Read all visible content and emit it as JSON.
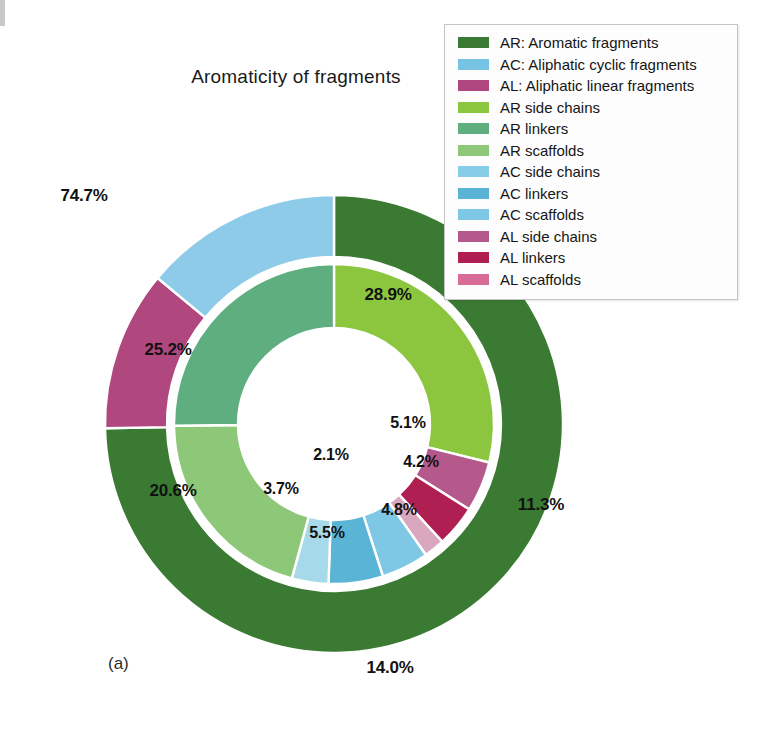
{
  "figure": {
    "panel_label": "(a)",
    "title": "Aromaticity of fragments"
  },
  "legend": {
    "items": [
      {
        "label": "AR: Aromatic fragments",
        "color": "#3b7a33"
      },
      {
        "label": "AC: Aliphatic cyclic fragments",
        "color": "#76c3e4"
      },
      {
        "label": "AL: Aliphatic linear fragments",
        "color": "#b0477e"
      },
      {
        "label": "AR side chains",
        "color": "#8cc63f"
      },
      {
        "label": "AR linkers",
        "color": "#5fae7f"
      },
      {
        "label": "AR scaffolds",
        "color": "#8dc878"
      },
      {
        "label": "AC side chains",
        "color": "#87cde8"
      },
      {
        "label": "AC linkers",
        "color": "#5ab4d6"
      },
      {
        "label": "AC scaffolds",
        "color": "#7ec8e6"
      },
      {
        "label": "AL side chains",
        "color": "#b5588c"
      },
      {
        "label": "AL linkers",
        "color": "#b01f52"
      },
      {
        "label": "AL scaffolds",
        "color": "#d96c96"
      }
    ]
  },
  "chart_data": {
    "type": "pie",
    "title": "Aromaticity of fragments",
    "subtitle": "",
    "xlabel": "",
    "ylabel": "",
    "units": "percent",
    "legend_position": "top-right",
    "rings": [
      {
        "name": "outer",
        "role": "fragment class totals",
        "slices": [
          {
            "label": "AR: Aromatic fragments",
            "short": "AR",
            "value": 74.7,
            "display": "74.7%",
            "color": "#3b7a33"
          },
          {
            "label": "AL: Aliphatic linear fragments",
            "short": "AL",
            "value": 11.3,
            "display": "11.3%",
            "color": "#b0477e"
          },
          {
            "label": "AC: Aliphatic cyclic fragments",
            "short": "AC",
            "value": 14.0,
            "display": "14.0%",
            "color": "#8ecbe8"
          }
        ]
      },
      {
        "name": "inner",
        "role": "fragment subtype breakdown",
        "slices": [
          {
            "label": "AR side chains",
            "value": 28.9,
            "display": "28.9%",
            "color": "#8cc63f"
          },
          {
            "label": "AL side chains",
            "value": 5.1,
            "display": "5.1%",
            "color": "#b5588c"
          },
          {
            "label": "AL linkers",
            "value": 4.2,
            "display": "4.2%",
            "color": "#b01f52"
          },
          {
            "label": "AL scaffolds",
            "value": 2.1,
            "display": "2.1%",
            "color": "#d9a8bf"
          },
          {
            "label": "AC scaffolds",
            "value": 4.8,
            "display": "4.8%",
            "color": "#7ec8e6"
          },
          {
            "label": "AC linkers",
            "value": 5.5,
            "display": "5.5%",
            "color": "#5ab4d6"
          },
          {
            "label": "AC side chains",
            "value": 3.7,
            "display": "3.7%",
            "color": "#a6d9ea"
          },
          {
            "label": "AR scaffolds",
            "value": 20.6,
            "display": "20.6%",
            "color": "#8dc878"
          },
          {
            "label": "AR linkers",
            "value": 25.2,
            "display": "25.2%",
            "color": "#5fae7f"
          }
        ]
      }
    ],
    "outer_labels": [
      {
        "text": "74.7%",
        "x": 84,
        "y": 196
      },
      {
        "text": "11.3%",
        "x": 541,
        "y": 505
      },
      {
        "text": "14.0%",
        "x": 390,
        "y": 668
      }
    ],
    "inner_labels": [
      {
        "text": "28.9%",
        "x": 388,
        "y": 295
      },
      {
        "text": "25.2%",
        "x": 168,
        "y": 350
      },
      {
        "text": "20.6%",
        "x": 173,
        "y": 491
      },
      {
        "text": "3.7%",
        "x": 281,
        "y": 489
      },
      {
        "text": "5.5%",
        "x": 327,
        "y": 533
      },
      {
        "text": "4.8%",
        "x": 399,
        "y": 510
      },
      {
        "text": "2.1%",
        "x": 331,
        "y": 455
      },
      {
        "text": "4.2%",
        "x": 421,
        "y": 462
      },
      {
        "text": "5.1%",
        "x": 408,
        "y": 423
      }
    ]
  }
}
